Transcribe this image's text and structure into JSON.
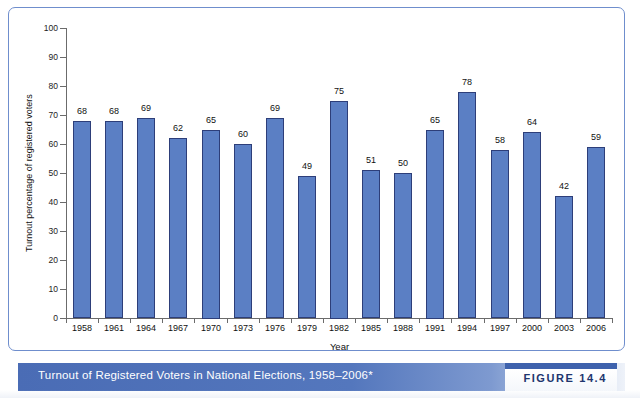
{
  "figure": {
    "caption": "Turnout of Registered Voters in National Elections, 1958–2006*",
    "number_label": "FIGURE 14.4"
  },
  "chart_data": {
    "type": "bar",
    "title": "Turnout of Registered Voters in National Elections, 1958–2006*",
    "xlabel": "Year",
    "ylabel": "Turnout percentage of registered voters",
    "ylim": [
      0,
      100
    ],
    "ytick_step": 10,
    "yticks": [
      0,
      10,
      20,
      30,
      40,
      50,
      60,
      70,
      80,
      90,
      100
    ],
    "grid": false,
    "legend": null,
    "bar_color": "#5b7fc4",
    "bar_border_color": "#2d3e79",
    "categories": [
      "1958",
      "1961",
      "1964",
      "1967",
      "1970",
      "1973",
      "1976",
      "1979",
      "1982",
      "1985",
      "1988",
      "1991",
      "1994",
      "1997",
      "2000",
      "2003",
      "2006"
    ],
    "values": [
      68,
      68,
      69,
      62,
      65,
      60,
      69,
      49,
      75,
      51,
      50,
      65,
      78,
      58,
      64,
      42,
      59
    ],
    "data_labels": [
      "68",
      "68",
      "69",
      "62",
      "65",
      "60",
      "69",
      "49",
      "75",
      "51",
      "50",
      "65",
      "78",
      "58",
      "64",
      "42",
      "59"
    ]
  }
}
